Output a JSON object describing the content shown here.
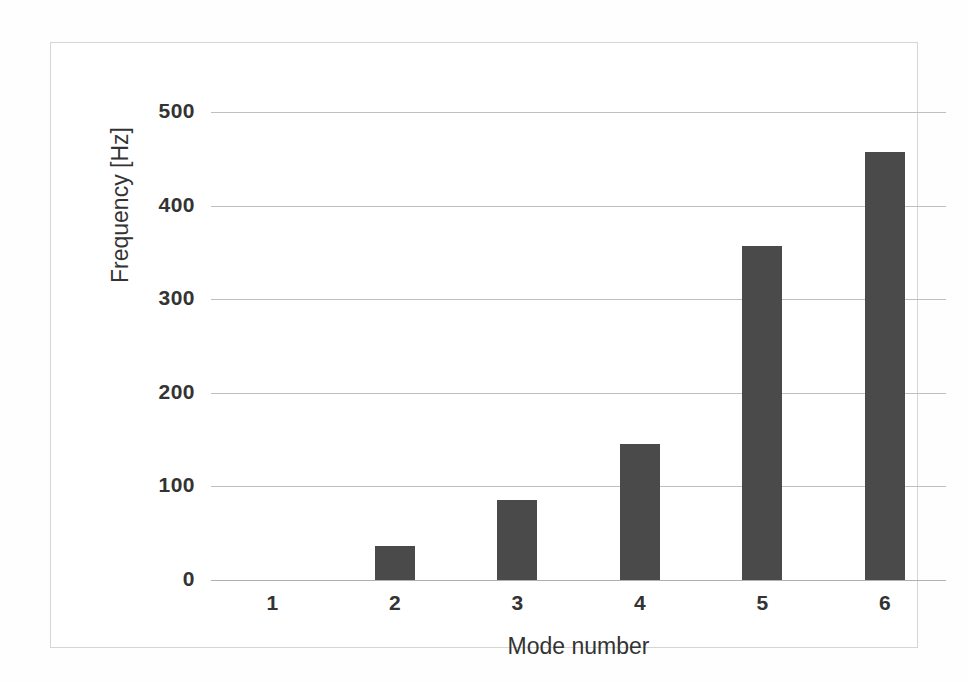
{
  "chart_data": {
    "type": "bar",
    "title": "",
    "xlabel": "Mode number",
    "ylabel": "Frequency [Hz]",
    "categories": [
      "1",
      "2",
      "3",
      "4",
      "5",
      "6"
    ],
    "values": [
      0,
      36,
      86,
      145,
      357,
      457
    ],
    "ylim": [
      0,
      500
    ],
    "yticks": [
      "0",
      "100",
      "200",
      "300",
      "400",
      "500"
    ],
    "ytick_values": [
      0,
      100,
      200,
      300,
      400,
      500
    ],
    "grid": true,
    "legend": false,
    "series": [
      {
        "name": "Frequency",
        "values": [
          0,
          36,
          86,
          145,
          357,
          457
        ]
      }
    ],
    "colors": {
      "bar": "#4a4a4a",
      "gridline": "#bfbfbf",
      "frame": "#d5d5d5",
      "background": "#ffffff",
      "text": "#333333"
    }
  }
}
